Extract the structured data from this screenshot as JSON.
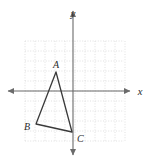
{
  "figure": {
    "type": "coordinate-geometry-diagram",
    "background_color": "#ffffff",
    "ink_color": "#3a3a3a",
    "grid_color": "#d9d9d9",
    "axis_color": "#6b6b6b"
  },
  "axes": {
    "x_label": "x",
    "y_label": "y",
    "origin_px": {
      "x": 73,
      "y": 91
    },
    "unit_px": 10,
    "x_range": [
      -7,
      6
    ],
    "y_range": [
      -6,
      6
    ],
    "arrowheads": [
      "left",
      "right",
      "up",
      "down"
    ],
    "tick_labels_shown": false
  },
  "grid": {
    "visible": true,
    "style": "dotted",
    "spacing_units": 1,
    "left_px": 25,
    "top_px": 41,
    "right_px": 124,
    "bottom_px": 141,
    "columns": 10,
    "rows": 10
  },
  "shape": {
    "name": "triangle ABC",
    "closed": true,
    "stroke_width": 1.3,
    "vertices": [
      {
        "label": "A",
        "x_units": -1.7,
        "y_units": 1.9,
        "px_x": 56,
        "px_y": 72,
        "label_px_x": 56,
        "label_px_y": 68,
        "label_anchor": "middle"
      },
      {
        "label": "B",
        "x_units": -3.7,
        "y_units": -3.3,
        "px_x": 36,
        "px_y": 124,
        "label_px_x": 30,
        "label_px_y": 130,
        "label_anchor": "end"
      },
      {
        "label": "C",
        "x_units": 0.0,
        "y_units": -4.1,
        "px_x": 72,
        "px_y": 132,
        "label_px_x": 77,
        "label_px_y": 142,
        "label_anchor": "start"
      }
    ]
  }
}
